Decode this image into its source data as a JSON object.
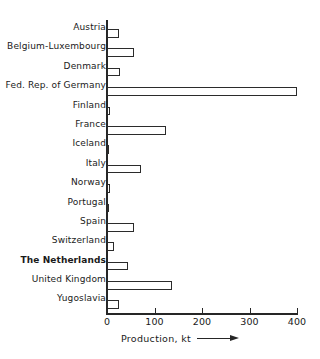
{
  "chart_data": {
    "type": "bar",
    "orientation": "horizontal",
    "title": "",
    "xlabel": "Production, kt",
    "ylabel": "",
    "xlim": [
      0,
      430
    ],
    "xticks": [
      0,
      100,
      200,
      300,
      400
    ],
    "xtick_labels": [
      "0",
      "100",
      "200",
      "300",
      "400"
    ],
    "grid": false,
    "legend": null,
    "units": "kt",
    "categories": [
      "Austria",
      "Belgium-Luxembourg",
      "Denmark",
      "Fed. Rep. of Germany",
      "Finland",
      "France",
      "Iceland",
      "Italy",
      "Norway",
      "Portugal",
      "Spain",
      "Switzerland",
      "The Netherlands",
      "United Kingdom",
      "Yugoslavia"
    ],
    "values": [
      25,
      56,
      28,
      400,
      6,
      124,
      5,
      72,
      7,
      4,
      57,
      15,
      44,
      137,
      25
    ],
    "emphasized_categories": [
      "The Netherlands"
    ]
  },
  "axis": {
    "x_title": "Production, kt",
    "arrow": "right-arrow"
  }
}
